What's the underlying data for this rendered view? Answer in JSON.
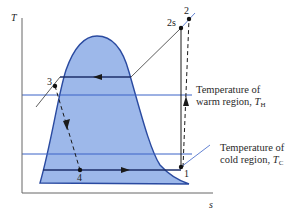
{
  "diagram": {
    "type": "T-s diagram",
    "axes": {
      "y_label": "T",
      "x_label": "s"
    },
    "colors": {
      "dome_fill": "#9db8ea",
      "dome_outline": "#2a4aa0",
      "region_lines": "#3b62c7",
      "process_lines": "#1a1a1a",
      "axis": "#555555"
    },
    "states": [
      {
        "id": "1",
        "label": "1"
      },
      {
        "id": "2s",
        "label": "2s"
      },
      {
        "id": "2",
        "label": "2"
      },
      {
        "id": "3",
        "label": "3"
      },
      {
        "id": "4",
        "label": "4"
      }
    ],
    "processes": [
      {
        "from": "1",
        "to": "2s",
        "style": "solid",
        "description": "isentropic compression"
      },
      {
        "from": "1",
        "to": "2",
        "style": "dashed",
        "description": "actual compression"
      },
      {
        "from": "2s",
        "to": "3",
        "style": "solid",
        "description": "heat rejection"
      },
      {
        "from": "3",
        "to": "4",
        "style": "dashed",
        "description": "throttling"
      },
      {
        "from": "4",
        "to": "1",
        "style": "solid",
        "description": "evaporation"
      }
    ],
    "annotations": {
      "warm": {
        "line1": "Temperature of",
        "line2": "warm region,",
        "symbol": "T",
        "subscript": "H"
      },
      "cold": {
        "line1": "Temperature of",
        "line2": "cold region,",
        "symbol": "T",
        "subscript": "C"
      }
    }
  }
}
